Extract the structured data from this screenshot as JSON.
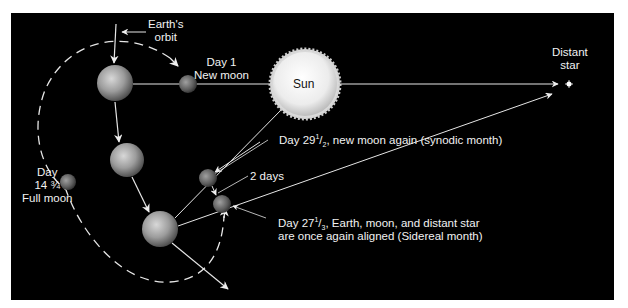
{
  "diagram": {
    "background_color": "#000000",
    "labels": {
      "earths_orbit_line1": "Earth's",
      "earths_orbit_line2": "orbit",
      "day1_line1": "Day 1",
      "day1_line2": "New moon",
      "sun": "Sun",
      "distant_star_line1": "Distant",
      "distant_star_line2": "star",
      "day29_prefix": "Day 29",
      "day29_frac_num": "1",
      "day29_frac_den": "2",
      "day29_suffix": ", new moon again (synodic month)",
      "two_days": "2 days",
      "full_moon_line1": "Day",
      "full_moon_line2": "14 ¾",
      "full_moon_line3": "Full moon",
      "day27_prefix": "Day 27",
      "day27_frac_num": "1",
      "day27_frac_den": "3",
      "day27_suffix": ", Earth, moon, and distant star",
      "day27_line2": "are once again aligned (Sidereal month)"
    },
    "bodies": [
      {
        "name": "earth-position-1",
        "cx": 115,
        "cy": 83,
        "r": 18
      },
      {
        "name": "earth-position-2",
        "cx": 127,
        "cy": 160,
        "r": 17
      },
      {
        "name": "earth-position-3",
        "cx": 160,
        "cy": 229,
        "r": 18
      },
      {
        "name": "moon-day-1-new",
        "cx": 188,
        "cy": 84,
        "r": 9
      },
      {
        "name": "moon-day-14-full",
        "cx": 68,
        "cy": 182,
        "r": 8
      },
      {
        "name": "moon-day-29-new",
        "cx": 208,
        "cy": 178,
        "r": 9
      },
      {
        "name": "moon-day-27-sidereal",
        "cx": 222,
        "cy": 204,
        "r": 9
      },
      {
        "name": "sun",
        "cx": 305,
        "cy": 84,
        "r": 32
      },
      {
        "name": "distant-star",
        "cx": 569,
        "cy": 84,
        "r": 3
      }
    ],
    "colors": {
      "sun_core": "#ffffff",
      "sun_edge": "#cfcfcf",
      "earth": "#9a9a9a",
      "moon": "#6e6e6e",
      "lines": "#e6e6e6"
    }
  }
}
